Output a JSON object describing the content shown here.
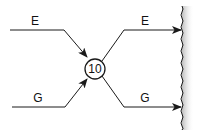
{
  "diagram": {
    "node": {
      "label": "10"
    },
    "inputs": [
      {
        "label": "E"
      },
      {
        "label": "G"
      }
    ],
    "outputs": [
      {
        "label": "E"
      },
      {
        "label": "G"
      }
    ],
    "colors": {
      "line": "#1a1a1a",
      "wall_shade": "#c8c8c8",
      "background": "#ffffff"
    }
  }
}
